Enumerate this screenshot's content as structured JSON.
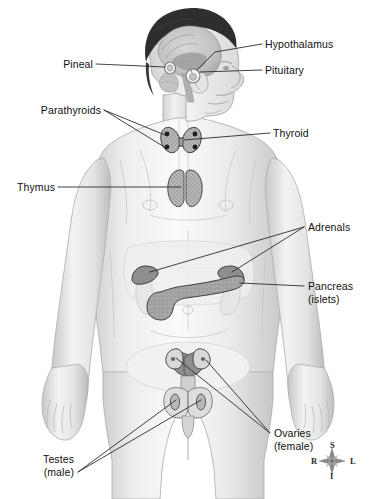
{
  "figure": {
    "background_color": "#ffffff",
    "line_color": "#2b2b2b",
    "text_color": "#111111",
    "gland_fill": "#9a9a9a",
    "body_fill": "#e8e8e8"
  },
  "labels": {
    "hypothalamus": "Hypothalamus",
    "pituitary": "Pituitary",
    "pineal": "Pineal",
    "parathyroids": "Parathyroids",
    "thyroid": "Thyroid",
    "thymus": "Thymus",
    "adrenals": "Adrenals",
    "pancreas_line1": "Pancreas",
    "pancreas_line2": "(islets)",
    "ovaries_line1": "Ovaries",
    "ovaries_line2": "(female)",
    "testes_line1": "Testes",
    "testes_line2": "(male)"
  },
  "compass": {
    "superior": "S",
    "inferior": "I",
    "right": "R",
    "left": "L"
  },
  "glands": [
    {
      "name": "pineal",
      "label": "Pineal",
      "side": "left",
      "region": "brain"
    },
    {
      "name": "hypothalamus",
      "label": "Hypothalamus",
      "side": "right",
      "region": "brain"
    },
    {
      "name": "pituitary",
      "label": "Pituitary",
      "side": "right",
      "region": "brain"
    },
    {
      "name": "parathyroids",
      "label": "Parathyroids",
      "side": "left",
      "region": "neck"
    },
    {
      "name": "thyroid",
      "label": "Thyroid",
      "side": "right",
      "region": "neck"
    },
    {
      "name": "thymus",
      "label": "Thymus",
      "side": "left",
      "region": "chest"
    },
    {
      "name": "adrenals",
      "label": "Adrenals",
      "side": "right",
      "region": "abdomen"
    },
    {
      "name": "pancreas",
      "label": "Pancreas (islets)",
      "side": "right",
      "region": "abdomen"
    },
    {
      "name": "ovaries",
      "label": "Ovaries (female)",
      "side": "right",
      "region": "pelvis"
    },
    {
      "name": "testes",
      "label": "Testes (male)",
      "side": "left",
      "region": "pelvis"
    }
  ]
}
